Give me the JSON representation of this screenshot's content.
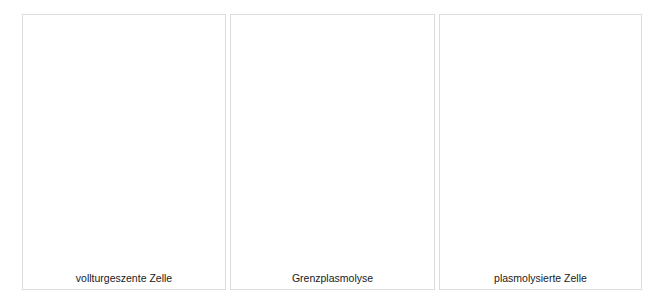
{
  "figure": {
    "panels": [
      {
        "id": "turgid",
        "caption": "vollturgeszente Zelle"
      },
      {
        "id": "incipient",
        "caption": "Grenzplasmolyse"
      },
      {
        "id": "plasmolyzed",
        "caption": "plasmolysierte Zelle"
      }
    ],
    "colors": {
      "panel_border": "#dcdcdc",
      "background": "#ffffff",
      "caption_text": "#1a1a1a"
    }
  }
}
